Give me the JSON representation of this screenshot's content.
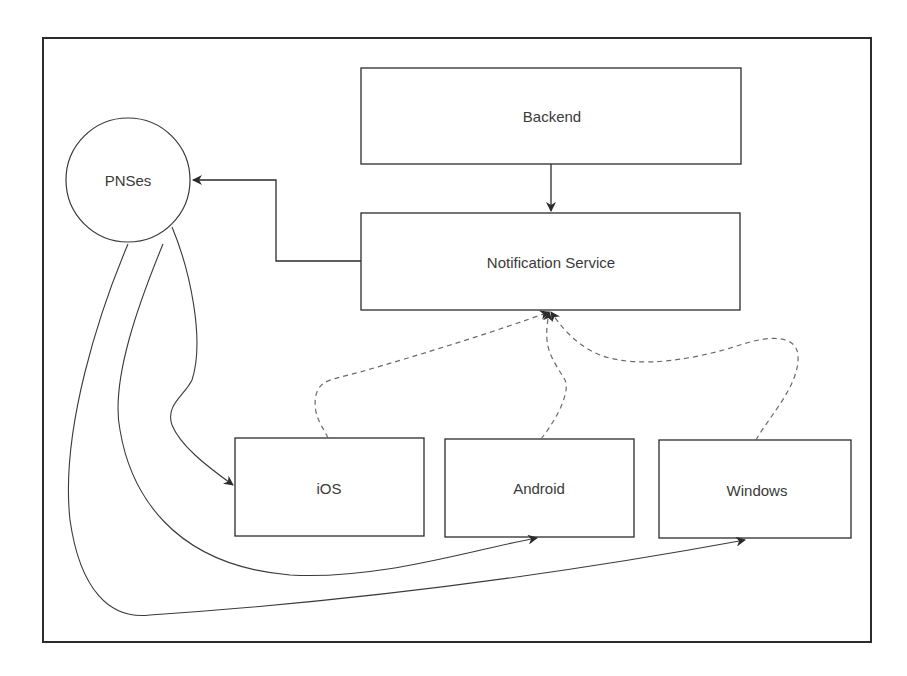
{
  "diagram": {
    "frame": {
      "x": 43,
      "y": 38,
      "width": 828,
      "height": 604
    },
    "nodes": [
      {
        "id": "backend",
        "label": "Backend",
        "shape": "rect",
        "x": 361,
        "y": 68,
        "width": 380,
        "height": 96
      },
      {
        "id": "notification-service",
        "label": "Notification Service",
        "shape": "rect",
        "x": 361,
        "y": 213,
        "width": 379,
        "height": 97
      },
      {
        "id": "pnses",
        "label": "PNSes",
        "shape": "circle",
        "cx": 128,
        "cy": 180,
        "r": 62
      },
      {
        "id": "ios",
        "label": "iOS",
        "shape": "rect",
        "x": 235,
        "y": 438,
        "width": 189,
        "height": 98
      },
      {
        "id": "android",
        "label": "Android",
        "shape": "rect",
        "x": 445,
        "y": 439,
        "width": 189,
        "height": 98
      },
      {
        "id": "windows",
        "label": "Windows",
        "shape": "rect",
        "x": 659,
        "y": 440,
        "width": 192,
        "height": 98
      }
    ],
    "edges": [
      {
        "from": "backend",
        "to": "notification-service",
        "style": "solid",
        "arrow": "end"
      },
      {
        "from": "notification-service",
        "to": "pnses",
        "style": "solid",
        "arrow": "end",
        "routing": "orthogonal"
      },
      {
        "from": "pnses",
        "to": "ios",
        "style": "solid",
        "arrow": "end",
        "routing": "curved"
      },
      {
        "from": "pnses",
        "to": "android",
        "style": "solid",
        "arrow": "end",
        "routing": "curved"
      },
      {
        "from": "pnses",
        "to": "windows",
        "style": "solid",
        "arrow": "end",
        "routing": "curved"
      },
      {
        "from": "ios",
        "to": "notification-service",
        "style": "dashed",
        "arrow": "end",
        "routing": "curved"
      },
      {
        "from": "android",
        "to": "notification-service",
        "style": "dashed",
        "arrow": "end",
        "routing": "curved"
      },
      {
        "from": "windows",
        "to": "notification-service",
        "style": "dashed",
        "arrow": "end",
        "routing": "curved"
      }
    ],
    "colors": {
      "stroke": "#2b2b2b",
      "dashed": "#6a6a6a",
      "text": "#3a3a3a",
      "background": "#ffffff"
    }
  }
}
